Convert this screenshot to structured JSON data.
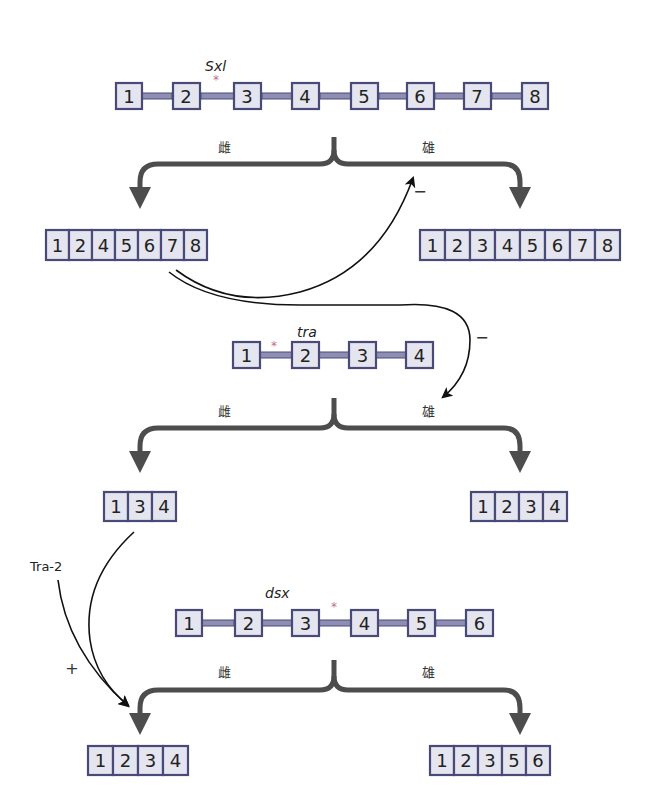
{
  "colors": {
    "exon_fill": "#e4e5ee",
    "exon_border": "#4a4a78",
    "intron_fill": "#8e8eb4",
    "splice_arrow": "#4d4d4d",
    "star": "#c0708a"
  },
  "genes": [
    {
      "name": "Sxl",
      "exons": [
        "1",
        "2",
        "3",
        "4",
        "5",
        "6",
        "7",
        "8"
      ],
      "star_between": "2-3",
      "female_label": "雌",
      "male_label": "雄",
      "female_mrna": [
        "1",
        "2",
        "4",
        "5",
        "6",
        "7",
        "8"
      ],
      "male_mrna": [
        "1",
        "2",
        "3",
        "4",
        "5",
        "6",
        "7",
        "8"
      ]
    },
    {
      "name": "tra",
      "exons": [
        "1",
        "2",
        "3",
        "4"
      ],
      "star_between": "1-2",
      "female_label": "雌",
      "male_label": "雄",
      "female_mrna": [
        "1",
        "3",
        "4"
      ],
      "male_mrna": [
        "1",
        "2",
        "3",
        "4"
      ]
    },
    {
      "name": "dsx",
      "exons": [
        "1",
        "2",
        "3",
        "4",
        "5",
        "6"
      ],
      "star_between": "3-4",
      "female_label": "雌",
      "male_label": "雄",
      "female_mrna": [
        "1",
        "2",
        "3",
        "4"
      ],
      "male_mrna": [
        "1",
        "2",
        "3",
        "5",
        "6"
      ]
    }
  ],
  "regulation": {
    "sxl_autoregulation_sign": "−",
    "sxl_to_tra_sign": "−",
    "tra2_label": "Tra-2",
    "tra_to_dsx_sign": "+"
  },
  "star_symbol": "*"
}
